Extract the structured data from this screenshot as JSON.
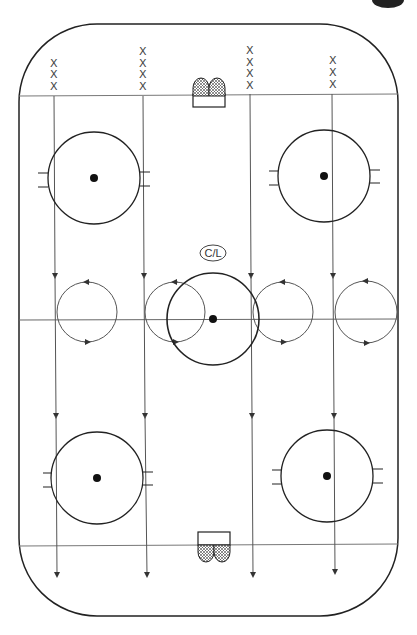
{
  "diagram": {
    "type": "hockey-drill",
    "center_label": "C/L",
    "player_marker": "X",
    "player_groups": [
      {
        "x": 54,
        "count": 3
      },
      {
        "x": 143,
        "count": 4
      },
      {
        "x": 250,
        "count": 4
      },
      {
        "x": 332,
        "count": 3
      }
    ],
    "lanes_x": [
      54,
      143,
      250,
      332
    ],
    "loops": [
      {
        "cx": 87,
        "cy": 312,
        "r": 30
      },
      {
        "cx": 175,
        "cy": 312,
        "r": 30
      },
      {
        "cx": 283,
        "cy": 312,
        "r": 30
      },
      {
        "cx": 365,
        "cy": 312,
        "r": 30
      }
    ],
    "faceoff_circles": [
      {
        "name": "top-left",
        "cx": 94,
        "cy": 178,
        "r": 46
      },
      {
        "name": "top-right",
        "cx": 324,
        "cy": 176,
        "r": 46
      },
      {
        "name": "center",
        "cx": 213,
        "cy": 319,
        "r": 46
      },
      {
        "name": "bottom-left",
        "cx": 97,
        "cy": 478,
        "r": 46
      },
      {
        "name": "bottom-right",
        "cx": 327,
        "cy": 476,
        "r": 46
      }
    ],
    "colors": {
      "line": "#555555",
      "board": "#222222",
      "dot": "#111111"
    }
  }
}
